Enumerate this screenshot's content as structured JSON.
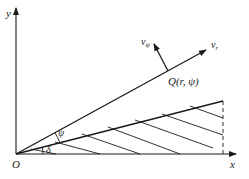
{
  "diagram": {
    "axes": {
      "x_label": "x",
      "y_label": "y",
      "origin_label": "O"
    },
    "point": {
      "label": "Q(r, ψ)"
    },
    "vectors": {
      "radial_label": "v",
      "radial_sub": "r",
      "tangential_label": "v",
      "tangential_sub": "ψ"
    },
    "angles": {
      "psi_label": "ψ",
      "delta_label": "δ"
    },
    "colors": {
      "line": "#1a1a1a",
      "background": "#ffffff"
    }
  }
}
